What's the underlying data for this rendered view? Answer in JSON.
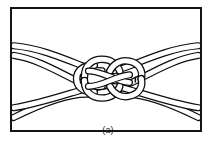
{
  "figure": {
    "caption": "(a)",
    "alt_label": "Square (reef) knot formed by two ropes",
    "colors": {
      "background": "#ffffff",
      "frame_stroke": "#141414",
      "rope_stroke": "#0d0d0d",
      "rope_fill": "#ffffff",
      "caption_text": "#1a1a1a"
    },
    "frame": {
      "x": 10,
      "y": 7,
      "width": 192,
      "height": 125,
      "border_width": 2
    },
    "rope": {
      "count": 2,
      "strand_width": 5,
      "outline_width": 1.2,
      "style": "double-line open rope",
      "ends": [
        "upper-left",
        "lower-left",
        "upper-right",
        "lower-right"
      ]
    },
    "knot": {
      "type": "square-knot",
      "center_x": 107,
      "center_y": 76,
      "loops": 4,
      "crossings": 4,
      "has_center_nip_mark": true
    }
  }
}
